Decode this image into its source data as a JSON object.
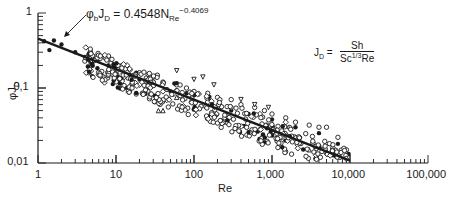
{
  "chart_data": {
    "type": "scatter",
    "title": "",
    "xlabel": "Re",
    "ylabel": "φJD",
    "xscale": "log",
    "yscale": "log",
    "xlim": [
      1,
      100000
    ],
    "ylim": [
      0.01,
      1
    ],
    "x_tick_labels": [
      "1",
      "10",
      "100",
      "1,000",
      "10,000",
      "100,000"
    ],
    "x_ticks": [
      1,
      10,
      100,
      1000,
      10000,
      100000
    ],
    "y_tick_labels": [
      "0,01",
      "0,1",
      "1"
    ],
    "y_ticks": [
      0.01,
      0.1,
      1
    ],
    "grid": false,
    "legend": null,
    "fit_line": {
      "equation": "φbJD = 0.4548 NRe^-0.4069",
      "coefficient": 0.4548,
      "exponent": -0.4069,
      "x_range": [
        1,
        10000
      ]
    },
    "annotations": [
      {
        "text": "φbJD = 0.4548N_Re^-0.4069",
        "type": "fit-equation-with-arrow"
      },
      {
        "text": "JD = Sh / (Sc^1/3 Re)",
        "type": "definition"
      }
    ],
    "series": [
      {
        "name": "filled-circles",
        "marker": "filled-circle",
        "points": [
          [
            1.2,
            0.42
          ],
          [
            1.4,
            0.32
          ],
          [
            1.6,
            0.43
          ],
          [
            2,
            0.38
          ],
          [
            3,
            0.3
          ],
          [
            4,
            0.26
          ],
          [
            6,
            0.24
          ],
          [
            8,
            0.2
          ],
          [
            10,
            0.18
          ],
          [
            15,
            0.15
          ],
          [
            20,
            0.13
          ],
          [
            30,
            0.12
          ],
          [
            50,
            0.09
          ],
          [
            80,
            0.085
          ],
          [
            150,
            0.07
          ],
          [
            300,
            0.05
          ],
          [
            500,
            0.045
          ],
          [
            1000,
            0.038
          ],
          [
            2000,
            0.03
          ],
          [
            4000,
            0.025
          ],
          [
            7000,
            0.018
          ]
        ]
      },
      {
        "name": "open-circles",
        "marker": "open-circle",
        "points": [
          [
            5,
            0.27
          ],
          [
            8,
            0.25
          ],
          [
            12,
            0.2
          ],
          [
            20,
            0.16
          ],
          [
            30,
            0.14
          ],
          [
            40,
            0.12
          ],
          [
            60,
            0.11
          ],
          [
            80,
            0.1
          ],
          [
            100,
            0.09
          ],
          [
            150,
            0.085
          ],
          [
            200,
            0.075
          ],
          [
            300,
            0.07
          ],
          [
            400,
            0.06
          ],
          [
            600,
            0.055
          ],
          [
            800,
            0.05
          ],
          [
            1000,
            0.045
          ],
          [
            1500,
            0.04
          ],
          [
            2000,
            0.035
          ],
          [
            3000,
            0.032
          ],
          [
            4000,
            0.03
          ],
          [
            5000,
            0.03
          ],
          [
            7000,
            0.022
          ],
          [
            9000,
            0.015
          ]
        ]
      },
      {
        "name": "open-diamonds",
        "marker": "open-diamond",
        "points": [
          [
            6,
            0.15
          ],
          [
            10,
            0.13
          ],
          [
            20,
            0.11
          ],
          [
            40,
            0.09
          ],
          [
            70,
            0.075
          ],
          [
            150,
            0.065
          ],
          [
            300,
            0.055
          ],
          [
            700,
            0.045
          ],
          [
            1500,
            0.035
          ]
        ]
      },
      {
        "name": "open-triangles-down",
        "marker": "open-triangle-down",
        "points": [
          [
            60,
            0.17
          ],
          [
            100,
            0.13
          ],
          [
            130,
            0.14
          ],
          [
            180,
            0.11
          ],
          [
            400,
            0.07
          ],
          [
            600,
            0.06
          ],
          [
            900,
            0.055
          ]
        ]
      },
      {
        "name": "open-triangles-up",
        "marker": "open-triangle-up",
        "points": [
          [
            35,
            0.05
          ],
          [
            40,
            0.05
          ],
          [
            60,
            0.075
          ],
          [
            3000,
            0.015
          ],
          [
            5000,
            0.014
          ]
        ]
      }
    ]
  }
}
